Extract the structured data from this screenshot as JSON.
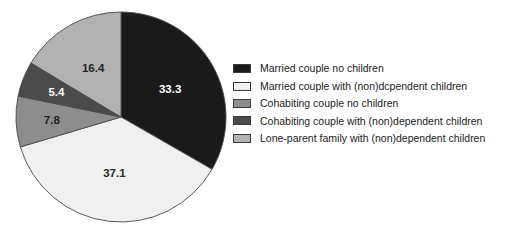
{
  "chart_data": {
    "type": "pie",
    "title": "",
    "subtitle": "",
    "xlabel": "",
    "ylabel": "",
    "grid": false,
    "legend_position": "right",
    "units": "percent",
    "total": 100.0,
    "start_angle_deg": 0,
    "direction": "clockwise",
    "categories": [
      "Married couple no children",
      "Married couple with (non)dcpendent children",
      "Cohabiting couple no children",
      "Cohabiting couple with (non)dependent children",
      "Lone-parent family with (non)dependent children"
    ],
    "values": [
      33.3,
      37.1,
      7.8,
      5.4,
      16.4
    ],
    "colors": [
      "#1a1a1a",
      "#f0f0ee",
      "#8d8d8d",
      "#4b4b4b",
      "#b2b2b2"
    ],
    "label_colors": [
      "#ffffff",
      "#272727",
      "#212121",
      "#ffffff",
      "#272727"
    ],
    "slice_labels": [
      "33.3",
      "37.1",
      "7.8",
      "5.4",
      "16.4"
    ],
    "slices": [
      {
        "label": "Married couple no children",
        "value": "33.3",
        "color": "#1a1a1a"
      },
      {
        "label": "Married couple with (non)dcpendent children",
        "value": "37.1",
        "color": "#f0f0ee"
      },
      {
        "label": "Cohabiting couple no children",
        "value": "7.8",
        "color": "#8d8d8d"
      },
      {
        "label": "Cohabiting couple with (non)dependent children",
        "value": "5.4",
        "color": "#4b4b4b"
      },
      {
        "label": "Lone-parent family with (non)dependent children",
        "value": "16.4",
        "color": "#b2b2b2"
      }
    ]
  },
  "legend": {
    "items": [
      {
        "label": "Married couple no children",
        "color": "#1a1a1a"
      },
      {
        "label": "Married couple with (non)dcpendent children",
        "color": "#f0f0ee"
      },
      {
        "label": "Cohabiting couple no children",
        "color": "#8d8d8d"
      },
      {
        "label": "Cohabiting couple with (non)dependent children",
        "color": "#4b4b4b"
      },
      {
        "label": "Lone-parent family with (non)dependent children",
        "color": "#b2b2b2"
      }
    ]
  }
}
